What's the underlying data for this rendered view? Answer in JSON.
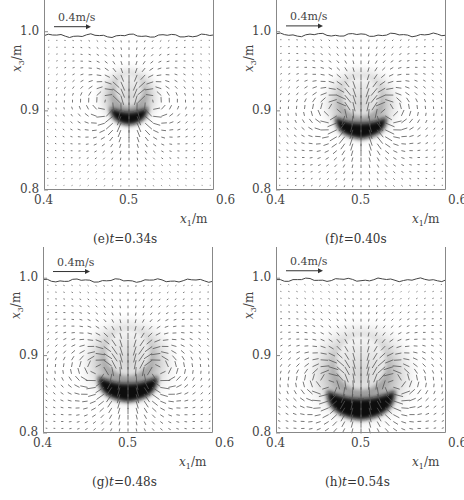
{
  "figure": {
    "panels": [
      {
        "id": "e",
        "caption_prefix": "(e)",
        "caption_var": "t",
        "caption_value": "=0.34s",
        "frame": {
          "left": 44,
          "top": 8,
          "width": 170,
          "height": 182
        },
        "surface_y": 0.995,
        "blob": {
          "cx": 0.5,
          "cy": 0.897,
          "rx": 0.022,
          "ry": 0.013,
          "halo_r": 0.045
        },
        "scale_label": "0.4m/s"
      },
      {
        "id": "f",
        "caption_prefix": "(f)",
        "caption_var": "t",
        "caption_value": "=0.40s",
        "frame": {
          "left": 276,
          "top": 8,
          "width": 170,
          "height": 182
        },
        "surface_y": 0.996,
        "blob": {
          "cx": 0.5,
          "cy": 0.883,
          "rx": 0.03,
          "ry": 0.016,
          "halo_r": 0.055
        },
        "scale_label": "0.4m/s"
      },
      {
        "id": "g",
        "caption_prefix": "(g)",
        "caption_var": "t",
        "caption_value": "=0.48s",
        "frame": {
          "left": 43,
          "top": 255,
          "width": 170,
          "height": 178
        },
        "surface_y": 0.997,
        "blob": {
          "cx": 0.5,
          "cy": 0.862,
          "rx": 0.035,
          "ry": 0.019,
          "halo_r": 0.065
        },
        "scale_label": "0.4m/s"
      },
      {
        "id": "h",
        "caption_prefix": "(h)",
        "caption_var": "t",
        "caption_value": "=0.54s",
        "frame": {
          "left": 276,
          "top": 255,
          "width": 170,
          "height": 178
        },
        "surface_y": 0.998,
        "blob": {
          "cx": 0.5,
          "cy": 0.842,
          "rx": 0.04,
          "ry": 0.022,
          "halo_r": 0.075
        },
        "scale_label": "0.4m/s"
      }
    ],
    "axes": {
      "x_ticks": [
        "0.4",
        "0.5",
        "0.6"
      ],
      "y_ticks": [
        "0.8",
        "0.9",
        "1.0"
      ],
      "x_label_var": "x",
      "x_label_sub": "1",
      "x_label_unit": "/m",
      "y_label_var": "x",
      "y_label_sub": "3",
      "y_label_unit": "/m",
      "xlim": [
        0.4,
        0.6
      ],
      "ylim": [
        0.8,
        1.03
      ]
    },
    "colors": {
      "axis": "#888888",
      "arrow": "#555555",
      "blob": "#111111",
      "surface": "#444444"
    }
  },
  "chart_data": [
    {
      "type": "heatmap",
      "title": "(e) t=0.34s",
      "xlabel": "x1/m",
      "ylabel": "x3/m",
      "xlim": [
        0.4,
        0.6
      ],
      "ylim": [
        0.8,
        1.03
      ],
      "x_ticks": [
        0.4,
        0.5,
        0.6
      ],
      "y_ticks": [
        0.8,
        0.9,
        1.0
      ],
      "annotations": [
        "0.4m/s reference arrow"
      ],
      "blob_center": [
        0.5,
        0.897
      ],
      "free_surface": 0.995
    },
    {
      "type": "heatmap",
      "title": "(f) t=0.40s",
      "xlabel": "x1/m",
      "ylabel": "x3/m",
      "xlim": [
        0.4,
        0.6
      ],
      "ylim": [
        0.8,
        1.03
      ],
      "x_ticks": [
        0.4,
        0.5,
        0.6
      ],
      "y_ticks": [
        0.8,
        0.9,
        1.0
      ],
      "annotations": [
        "0.4m/s reference arrow"
      ],
      "blob_center": [
        0.5,
        0.883
      ],
      "free_surface": 0.996
    },
    {
      "type": "heatmap",
      "title": "(g) t=0.48s",
      "xlabel": "x1/m",
      "ylabel": "x3/m",
      "xlim": [
        0.4,
        0.6
      ],
      "ylim": [
        0.8,
        1.03
      ],
      "x_ticks": [
        0.4,
        0.5,
        0.6
      ],
      "y_ticks": [
        0.8,
        0.9,
        1.0
      ],
      "annotations": [
        "0.4m/s reference arrow"
      ],
      "blob_center": [
        0.5,
        0.862
      ],
      "free_surface": 0.997
    },
    {
      "type": "heatmap",
      "title": "(h) t=0.54s",
      "xlabel": "x1/m",
      "ylabel": "x3/m",
      "xlim": [
        0.4,
        0.6
      ],
      "ylim": [
        0.8,
        1.03
      ],
      "x_ticks": [
        0.4,
        0.5,
        0.6
      ],
      "y_ticks": [
        0.8,
        0.9,
        1.0
      ],
      "annotations": [
        "0.4m/s reference arrow"
      ],
      "blob_center": [
        0.5,
        0.842
      ],
      "free_surface": 0.998
    }
  ]
}
